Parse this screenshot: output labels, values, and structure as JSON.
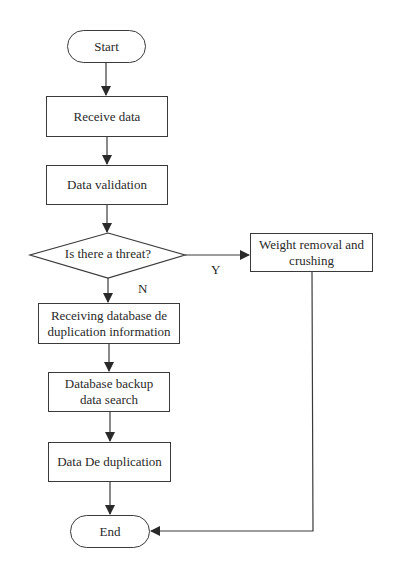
{
  "diagram": {
    "type": "flowchart",
    "nodes": {
      "start": {
        "label": "Start",
        "shape": "terminal"
      },
      "receive": {
        "label": "Receive data",
        "shape": "process"
      },
      "validate": {
        "label": "Data validation",
        "shape": "process"
      },
      "decision": {
        "label": "Is there a threat?",
        "shape": "decision"
      },
      "weight": {
        "label": "Weight removal and crushing",
        "shape": "process"
      },
      "receiving_db": {
        "label": "Receiving database de duplication information",
        "shape": "process"
      },
      "backup": {
        "label": "Database backup data search",
        "shape": "process"
      },
      "dedup": {
        "label": "Data De duplication",
        "shape": "process"
      },
      "end": {
        "label": "End",
        "shape": "terminal"
      }
    },
    "edge_labels": {
      "yes": "Y",
      "no": "N"
    },
    "edges": [
      {
        "from": "start",
        "to": "receive"
      },
      {
        "from": "receive",
        "to": "validate"
      },
      {
        "from": "validate",
        "to": "decision"
      },
      {
        "from": "decision",
        "to": "weight",
        "label": "Y"
      },
      {
        "from": "decision",
        "to": "receiving_db",
        "label": "N"
      },
      {
        "from": "receiving_db",
        "to": "backup"
      },
      {
        "from": "backup",
        "to": "dedup"
      },
      {
        "from": "dedup",
        "to": "end"
      },
      {
        "from": "weight",
        "to": "end"
      }
    ],
    "colors": {
      "stroke": "#3a3a3a",
      "background": "#ffffff",
      "text": "#2a2a2a"
    }
  }
}
